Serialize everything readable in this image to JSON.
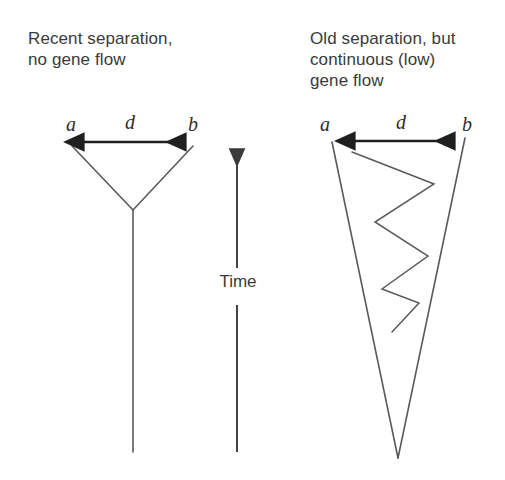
{
  "figure": {
    "background_color": "#ffffff",
    "line_color": "#5a5a5a",
    "arrow_color": "#1f1f1f",
    "text_color": "#3a3a3a"
  },
  "panels": {
    "left": {
      "caption": "Recent separation,\nno gene flow",
      "tip_a_label": "a",
      "tip_b_label": "b",
      "distance_label": "d",
      "topology": "Y-shaped bifurcating tree, shallow split",
      "tips": [
        {
          "name": "a",
          "x": 72,
          "y": 146
        },
        {
          "name": "b",
          "x": 193,
          "y": 146
        }
      ],
      "coalescent_node": {
        "x": 133,
        "y": 210
      },
      "stem_bottom": {
        "x": 133,
        "y": 452
      },
      "distance_arrow": {
        "x1": 81,
        "x2": 183,
        "y": 142
      }
    },
    "right": {
      "caption": "Old separation, but\ncontinuous (low)\ngene flow",
      "tip_a_label": "a",
      "tip_b_label": "b",
      "distance_label": "d",
      "topology": "Deep V-shaped tree with zigzag migration path between lineages",
      "tips": [
        {
          "name": "a",
          "x": 332,
          "y": 142
        },
        {
          "name": "b",
          "x": 465,
          "y": 138
        }
      ],
      "coalescent_node": {
        "x": 398,
        "y": 458
      },
      "distance_arrow": {
        "x1": 352,
        "x2": 452,
        "y": 141
      },
      "gene_flow_path": [
        {
          "x": 352,
          "y": 152
        },
        {
          "x": 434,
          "y": 184
        },
        {
          "x": 375,
          "y": 222
        },
        {
          "x": 428,
          "y": 256
        },
        {
          "x": 382,
          "y": 289
        },
        {
          "x": 419,
          "y": 303
        },
        {
          "x": 392,
          "y": 332
        }
      ]
    }
  },
  "time_axis": {
    "label": "Time",
    "direction": "upward",
    "x": 237,
    "arrow_tip_y": 152,
    "upper_segment_bottom_y": 268,
    "lower_segment_top_y": 305,
    "bottom_y": 452
  }
}
